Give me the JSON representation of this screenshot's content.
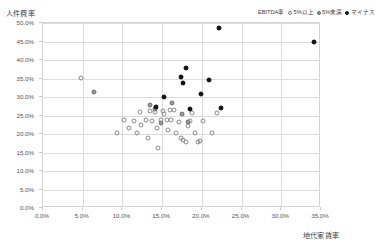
{
  "chart_data": {
    "type": "scatter",
    "title": "",
    "xlabel": "地代家賃率",
    "ylabel": "人件費率",
    "xlim": [
      0,
      35
    ],
    "ylim": [
      0,
      50
    ],
    "xticks": [
      "0.0%",
      "5.0%",
      "10.0%",
      "15.0%",
      "20.0%",
      "25.0%",
      "30.0%",
      "35.0%"
    ],
    "yticks": [
      "0.0%",
      "5.0%",
      "10.0%",
      "15.0%",
      "20.0%",
      "25.0%",
      "30.0%",
      "35.0%",
      "40.0%",
      "45.0%",
      "50.0%"
    ],
    "xtick_values": [
      0,
      5,
      10,
      15,
      20,
      25,
      30,
      35
    ],
    "ytick_values": [
      0,
      5,
      10,
      15,
      20,
      25,
      30,
      35,
      40,
      45,
      50
    ],
    "grid": true,
    "legend_position": "top-right",
    "legend_title": "EBITDA率",
    "series": [
      {
        "name": "5%以上",
        "marker": "open-circle",
        "color": "#8a8a8a",
        "points": [
          [
            4.9,
            34.9
          ],
          [
            9.5,
            20.1
          ],
          [
            10.3,
            23.6
          ],
          [
            10.9,
            21.4
          ],
          [
            11.6,
            23.3
          ],
          [
            11.9,
            20.0
          ],
          [
            12.3,
            25.6
          ],
          [
            12.5,
            22.2
          ],
          [
            13.1,
            23.6
          ],
          [
            13.4,
            18.6
          ],
          [
            13.6,
            25.9
          ],
          [
            13.9,
            23.3
          ],
          [
            14.2,
            25.7
          ],
          [
            14.5,
            21.4
          ],
          [
            14.6,
            15.9
          ],
          [
            15.0,
            23.4
          ],
          [
            15.2,
            26.0
          ],
          [
            15.4,
            25.2
          ],
          [
            15.7,
            23.5
          ],
          [
            15.9,
            20.8
          ],
          [
            16.1,
            26.2
          ],
          [
            16.3,
            23.4
          ],
          [
            16.6,
            26.1
          ],
          [
            16.9,
            19.9
          ],
          [
            17.2,
            23.1
          ],
          [
            17.5,
            18.6
          ],
          [
            17.8,
            18.0
          ],
          [
            18.1,
            17.6
          ],
          [
            18.4,
            21.9
          ],
          [
            18.6,
            23.2
          ],
          [
            18.9,
            25.4
          ],
          [
            19.3,
            20.0
          ],
          [
            19.6,
            17.5
          ],
          [
            19.9,
            17.8
          ],
          [
            20.3,
            23.2
          ],
          [
            21.4,
            19.9
          ],
          [
            22.0,
            25.5
          ]
        ]
      },
      {
        "name": "5%未満",
        "marker": "filled-gray-circle",
        "color": "#9a9a9a",
        "points": [
          [
            6.6,
            31.0
          ],
          [
            13.6,
            27.6
          ],
          [
            14.2,
            26.4
          ],
          [
            15.0,
            22.8
          ],
          [
            16.4,
            28.0
          ],
          [
            17.6,
            25.2
          ],
          [
            18.4,
            22.9
          ]
        ]
      },
      {
        "name": "マイナス",
        "marker": "filled-black-circle",
        "color": "#111111",
        "points": [
          [
            14.3,
            26.9
          ],
          [
            15.3,
            29.8
          ],
          [
            17.5,
            35.1
          ],
          [
            17.7,
            33.6
          ],
          [
            18.1,
            37.5
          ],
          [
            18.6,
            26.5
          ],
          [
            20.0,
            30.6
          ],
          [
            21.0,
            34.2
          ],
          [
            22.3,
            48.5
          ],
          [
            22.5,
            26.8
          ],
          [
            34.2,
            44.6
          ]
        ]
      }
    ]
  },
  "legend": {
    "title": "EBITDA率",
    "items": [
      {
        "label": "5%以上",
        "marker": "open-circle"
      },
      {
        "label": "5%未満",
        "marker": "filled-gray-circle"
      },
      {
        "label": "マイナス",
        "marker": "filled-black-circle"
      }
    ]
  },
  "axes": {
    "y_axis_title": "人件費率",
    "x_axis_title": "地代家賃率"
  }
}
